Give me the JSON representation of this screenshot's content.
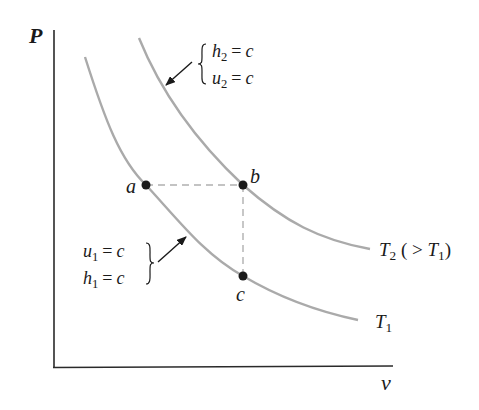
{
  "diagram": {
    "axes": {
      "y_label": "P",
      "x_label": "v"
    },
    "colors": {
      "axis": "#2a2a2a",
      "curve": "#aaaaaa",
      "dashed": "#b0b0b0",
      "point": "#1a1a1a",
      "text": "#1a1a1a"
    },
    "curves": [
      {
        "id": "T1",
        "label_main": "T",
        "label_sub": "1",
        "label_suffix": "",
        "annotations": [
          {
            "lhs": "u",
            "sub": "1",
            "op": "=",
            "rhs": "c"
          },
          {
            "lhs": "h",
            "sub": "1",
            "op": "=",
            "rhs": "c"
          }
        ]
      },
      {
        "id": "T2",
        "label_main": "T",
        "label_sub": "2",
        "label_suffix_open": "( > ",
        "label_suffix_T": "T",
        "label_suffix_sub": "1",
        "label_suffix_close": ")",
        "annotations": [
          {
            "lhs": "h",
            "sub": "2",
            "op": "=",
            "rhs": "c"
          },
          {
            "lhs": "u",
            "sub": "2",
            "op": "=",
            "rhs": "c"
          }
        ]
      }
    ],
    "points": [
      {
        "id": "a",
        "label": "a",
        "on_curve": "T1"
      },
      {
        "id": "b",
        "label": "b",
        "on_curve": "T2"
      },
      {
        "id": "c",
        "label": "c",
        "on_curve": "T1"
      }
    ],
    "dashed_paths": [
      "a-b horizontal",
      "b-c vertical"
    ]
  }
}
